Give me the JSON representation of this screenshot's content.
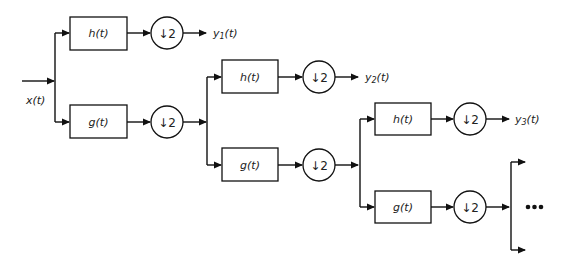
{
  "diagram": {
    "input_label": "x(t)",
    "stages": [
      {
        "highpass_label": "h(t)",
        "lowpass_label": "g(t)",
        "downsample_label": "↓2",
        "output_label_main": "y",
        "output_label_sub": "1",
        "output_label_tail": "(t)"
      },
      {
        "highpass_label": "h(t)",
        "lowpass_label": "g(t)",
        "downsample_label": "↓2",
        "output_label_main": "y",
        "output_label_sub": "2",
        "output_label_tail": "(t)"
      },
      {
        "highpass_label": "h(t)",
        "lowpass_label": "g(t)",
        "downsample_label": "↓2",
        "output_label_main": "y",
        "output_label_sub": "3",
        "output_label_tail": "(t)"
      }
    ],
    "continuation_label": "•••"
  }
}
